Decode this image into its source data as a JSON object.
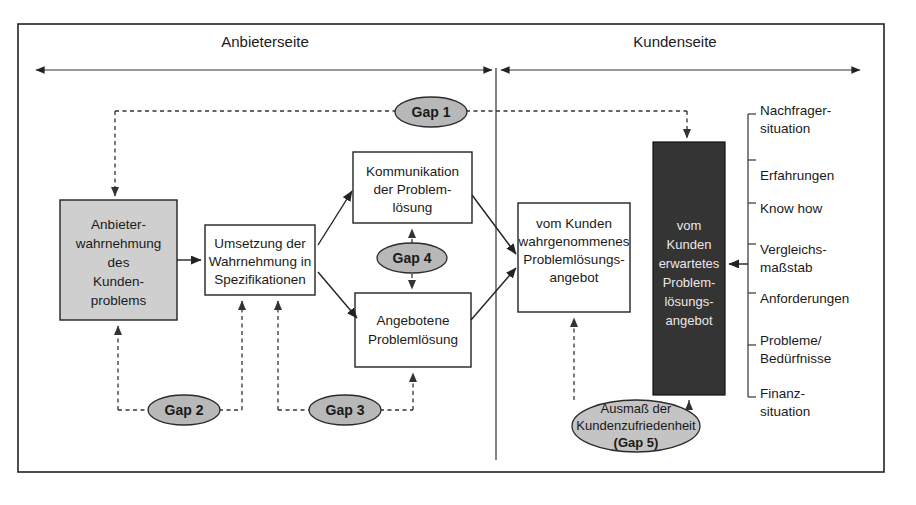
{
  "diagram": {
    "headers": [
      {
        "id": "provider-side",
        "label": "Anbieterseite"
      },
      {
        "id": "customer-side",
        "label": "Kundenseite"
      }
    ],
    "boxes": [
      {
        "id": "anbieterwahrnehmung",
        "fill": "#cfcfcf",
        "lines": [
          "Anbieter-",
          "wahrnehmung",
          "des",
          "Kunden-",
          "problems"
        ]
      },
      {
        "id": "umsetzung",
        "fill": "#ffffff",
        "lines": [
          "Umsetzung der",
          "Wahrnehmung in",
          "Spezifikationen"
        ]
      },
      {
        "id": "kommunikation",
        "fill": "#ffffff",
        "lines": [
          "Kommunikation",
          "der Problem-",
          "lösung"
        ]
      },
      {
        "id": "angebotene-problemloesung",
        "fill": "#ffffff",
        "lines": [
          "Angebotene",
          "Problemlösung"
        ]
      },
      {
        "id": "wahrgenommenes-angebot",
        "fill": "#ffffff",
        "lines": [
          "vom Kunden",
          "wahrgenommenes",
          "Problemlösungs-",
          "angebot"
        ]
      },
      {
        "id": "erwartetes-angebot",
        "fill": "#343434",
        "lines": [
          "vom",
          "Kunden",
          "erwartetes",
          "Problem-",
          "lösungs-",
          "angebot"
        ]
      }
    ],
    "gaps": [
      {
        "id": "gap-1",
        "label": "Gap 1"
      },
      {
        "id": "gap-2",
        "label": "Gap 2"
      },
      {
        "id": "gap-3",
        "label": "Gap 3"
      },
      {
        "id": "gap-4",
        "label": "Gap 4"
      },
      {
        "id": "gap-5",
        "lines": [
          "Ausmaß der",
          "Kundenzufriedenheit",
          "(Gap 5)"
        ]
      }
    ],
    "influences": [
      {
        "id": "nachfragersituation",
        "lines": [
          "Nachfrager-",
          "situation"
        ]
      },
      {
        "id": "erfahrungen",
        "lines": [
          "Erfahrungen"
        ]
      },
      {
        "id": "know-how",
        "lines": [
          "Know  how"
        ]
      },
      {
        "id": "vergleichsmassstab",
        "lines": [
          "Vergleichs-",
          "maßstab"
        ]
      },
      {
        "id": "anforderungen",
        "lines": [
          "Anforderungen"
        ]
      },
      {
        "id": "probleme-beduerfnisse",
        "lines": [
          "Probleme/",
          "Bedürfnisse"
        ]
      },
      {
        "id": "finanzsituation",
        "lines": [
          "Finanz-",
          "situation"
        ]
      }
    ],
    "colors": {
      "gray_box": "#cfcfcf",
      "dark_box": "#343434",
      "gap_ellipse": "#b8b8b8",
      "line": "#222222"
    }
  }
}
